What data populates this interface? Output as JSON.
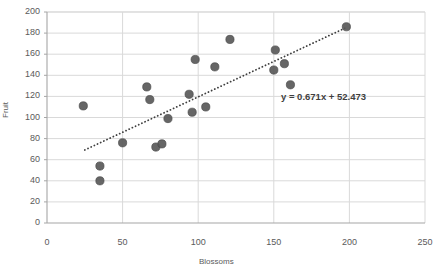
{
  "chart_data": {
    "type": "scatter",
    "title": "",
    "xlabel": "Blossoms",
    "ylabel": "Fruit",
    "xlim": [
      0,
      250
    ],
    "ylim": [
      0,
      200
    ],
    "xticks": [
      0,
      50,
      100,
      150,
      200,
      250
    ],
    "yticks": [
      0,
      20,
      40,
      60,
      80,
      100,
      120,
      140,
      160,
      180,
      200
    ],
    "grid": "horizontal-and-vertical",
    "legend": "none",
    "marker_color": "#595959",
    "gridline_color": "#d9d9d9",
    "points": [
      {
        "x": 24,
        "y": 111
      },
      {
        "x": 35,
        "y": 54
      },
      {
        "x": 35,
        "y": 40
      },
      {
        "x": 50,
        "y": 76
      },
      {
        "x": 66,
        "y": 129
      },
      {
        "x": 68,
        "y": 117
      },
      {
        "x": 72,
        "y": 72
      },
      {
        "x": 76,
        "y": 75
      },
      {
        "x": 80,
        "y": 99
      },
      {
        "x": 94,
        "y": 122
      },
      {
        "x": 96,
        "y": 105
      },
      {
        "x": 98,
        "y": 155
      },
      {
        "x": 105,
        "y": 110
      },
      {
        "x": 111,
        "y": 148
      },
      {
        "x": 121,
        "y": 174
      },
      {
        "x": 150,
        "y": 145
      },
      {
        "x": 151,
        "y": 164
      },
      {
        "x": 157,
        "y": 151
      },
      {
        "x": 161,
        "y": 131
      },
      {
        "x": 198,
        "y": 186
      }
    ],
    "trendline": {
      "equation": "y = 0.671x + 52.473",
      "slope": 0.671,
      "intercept": 52.473,
      "style": "dotted",
      "color": "#3f3f3f",
      "x_start": 25,
      "x_end": 198
    }
  },
  "axis": {
    "y_title": "Fruit",
    "x_title": "Blossoms"
  }
}
